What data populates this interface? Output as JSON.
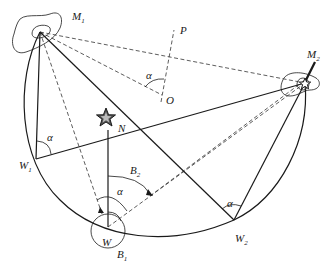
{
  "diagram": {
    "type": "geometric construction (inscribed angle / two-landmark position circle)",
    "colors": {
      "stroke": "#1a1a1a",
      "background": "#ffffff"
    },
    "points": {
      "M1": {
        "label": "M",
        "sub": "1"
      },
      "M2": {
        "label": "M",
        "sub": "2"
      },
      "O": {
        "label": "O"
      },
      "P": {
        "label": "P"
      },
      "N": {
        "label": "N"
      },
      "W1": {
        "label": "W",
        "sub": "1"
      },
      "W": {
        "label": "W"
      },
      "W2": {
        "label": "W",
        "sub": "2"
      },
      "B1": {
        "label": "B",
        "sub": "1"
      },
      "B2": {
        "label": "B",
        "sub": "2"
      }
    },
    "angles": {
      "alpha_O": "α",
      "alpha_W1": "α",
      "alpha_W": "α",
      "alpha_W2": "α"
    },
    "icons": [
      "north-star-icon",
      "landmark-star-icon"
    ]
  }
}
